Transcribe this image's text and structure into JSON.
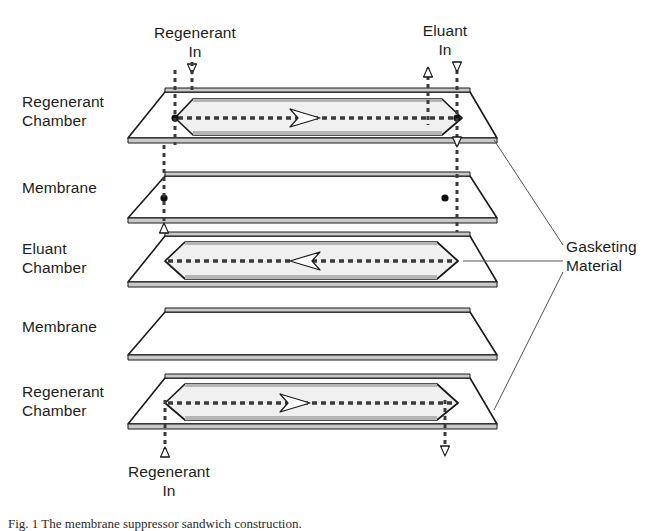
{
  "figure": {
    "caption": "Fig. 1 The membrane suppressor sandwich construction."
  },
  "colors": {
    "outline": "#1a1a1a",
    "gasket_fill": "#f0f0f0",
    "edge_shade": "#9a9a9a",
    "port_dash": "#3a3a3a",
    "leader": "#555555",
    "text": "#1d1d1d",
    "background": "#ffffff"
  },
  "inlet_labels": {
    "regenerant_in_top": "Regenerant\nIn",
    "eluant_in_top": "Eluant\nIn",
    "regenerant_in_bottom": "Regenerant\nIn"
  },
  "layer_labels": [
    {
      "id": "regenerant-chamber-top",
      "text": "Regenerant\nChamber",
      "top": 93
    },
    {
      "id": "membrane-upper",
      "text": "Membrane",
      "top": 179
    },
    {
      "id": "eluant-chamber",
      "text": "Eluant\nChamber",
      "top": 240
    },
    {
      "id": "membrane-lower",
      "text": "Membrane",
      "top": 318
    },
    {
      "id": "regenerant-chamber-bottom",
      "text": "Regenerant\nChamber",
      "top": 383
    }
  ],
  "annotation": {
    "gasketing_material": "Gasketing\nMaterial"
  },
  "layers": [
    {
      "id": "regenerant-chamber-top",
      "name": "Regenerant Chamber",
      "type": "chamber",
      "flow_direction": "right",
      "has_gasket_cutout": true,
      "has_port_holes": true
    },
    {
      "id": "membrane-upper",
      "name": "Membrane",
      "type": "membrane",
      "flow_direction": "none",
      "has_gasket_cutout": false,
      "has_port_holes": true
    },
    {
      "id": "eluant-chamber",
      "name": "Eluant Chamber",
      "type": "chamber",
      "flow_direction": "left",
      "has_gasket_cutout": true,
      "has_port_holes": false
    },
    {
      "id": "membrane-lower",
      "name": "Membrane",
      "type": "membrane",
      "flow_direction": "none",
      "has_gasket_cutout": false,
      "has_port_holes": false
    },
    {
      "id": "regenerant-chamber-bottom",
      "name": "Regenerant Chamber",
      "type": "chamber",
      "flow_direction": "right",
      "has_gasket_cutout": true,
      "has_port_holes": false
    }
  ],
  "ports": [
    {
      "id": "regenerant-in-port",
      "x": 175,
      "marker": "down-triangle",
      "side": "left"
    },
    {
      "id": "regenerant-riser",
      "x": 148,
      "marker": "up-triangle",
      "side": "left"
    },
    {
      "id": "eluant-out-riser",
      "x": 428,
      "marker": "up-triangle",
      "side": "right"
    },
    {
      "id": "eluant-in-port",
      "x": 457,
      "marker": "down-triangle",
      "side": "right"
    }
  ],
  "icons": {
    "flow_arrow_right": "flow-arrow-right-icon",
    "flow_arrow_left": "flow-arrow-left-icon",
    "port_up": "port-arrow-up-icon",
    "port_down": "port-arrow-down-icon",
    "port_hole": "port-hole-icon"
  }
}
